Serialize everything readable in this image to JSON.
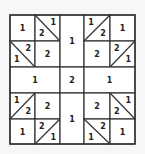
{
  "diagram": {
    "title": "",
    "colors": {
      "line": "#333333",
      "background": "#f7f7f7",
      "text": "#222222"
    },
    "grid": {
      "x": [
        10,
        35,
        60,
        84,
        110,
        135
      ],
      "y": [
        15,
        41,
        67,
        93,
        119,
        144
      ]
    },
    "cells": [
      {
        "id": "q-tl-a",
        "area": [
          0,
          0,
          1,
          1
        ],
        "label": "1"
      },
      {
        "id": "q-tl-b",
        "area": [
          1,
          0,
          2,
          1
        ],
        "diagonal": "tl-br",
        "labels": {
          "tr": "1",
          "bl": "2"
        }
      },
      {
        "id": "q-tl-c",
        "area": [
          0,
          1,
          1,
          2
        ],
        "diagonal": "tl-br",
        "labels": {
          "tr": "2",
          "bl": "1"
        }
      },
      {
        "id": "q-tl-d",
        "area": [
          1,
          1,
          2,
          2
        ],
        "label": "2"
      },
      {
        "id": "center-top",
        "area": [
          2,
          0,
          3,
          2
        ],
        "label": "1"
      },
      {
        "id": "q-tr-a",
        "area": [
          3,
          0,
          4,
          1
        ],
        "diagonal": "bl-tr",
        "labels": {
          "tl": "1",
          "br": "2"
        }
      },
      {
        "id": "q-tr-b",
        "area": [
          4,
          0,
          5,
          1
        ],
        "label": "1"
      },
      {
        "id": "q-tr-c",
        "area": [
          3,
          1,
          4,
          2
        ],
        "label": "2"
      },
      {
        "id": "q-tr-d",
        "area": [
          4,
          1,
          5,
          2
        ],
        "diagonal": "bl-tr",
        "labels": {
          "tl": "2",
          "br": "1"
        }
      },
      {
        "id": "middle-left",
        "area": [
          0,
          2,
          2,
          3
        ],
        "label": "1"
      },
      {
        "id": "center",
        "area": [
          2,
          2,
          3,
          3
        ],
        "label": "2"
      },
      {
        "id": "middle-right",
        "area": [
          3,
          2,
          5,
          3
        ],
        "label": "1"
      },
      {
        "id": "q-bl-a",
        "area": [
          0,
          3,
          1,
          4
        ],
        "diagonal": "bl-tr",
        "labels": {
          "tl": "1",
          "br": "2"
        }
      },
      {
        "id": "q-bl-b",
        "area": [
          1,
          3,
          2,
          4
        ],
        "label": "2"
      },
      {
        "id": "q-bl-c",
        "area": [
          0,
          4,
          1,
          5
        ],
        "label": "1"
      },
      {
        "id": "q-bl-d",
        "area": [
          1,
          4,
          2,
          5
        ],
        "diagonal": "bl-tr",
        "labels": {
          "tl": "2",
          "br": "1"
        }
      },
      {
        "id": "center-bottom",
        "area": [
          2,
          3,
          3,
          5
        ],
        "label": "1"
      },
      {
        "id": "q-br-a",
        "area": [
          3,
          3,
          4,
          4
        ],
        "label": "2"
      },
      {
        "id": "q-br-b",
        "area": [
          4,
          3,
          5,
          4
        ],
        "diagonal": "tl-br",
        "labels": {
          "tr": "1",
          "bl": "2"
        }
      },
      {
        "id": "q-br-c",
        "area": [
          3,
          4,
          4,
          5
        ],
        "diagonal": "tl-br",
        "labels": {
          "tr": "2",
          "bl": "1"
        }
      },
      {
        "id": "q-br-d",
        "area": [
          4,
          4,
          5,
          5
        ],
        "label": "1"
      }
    ]
  }
}
